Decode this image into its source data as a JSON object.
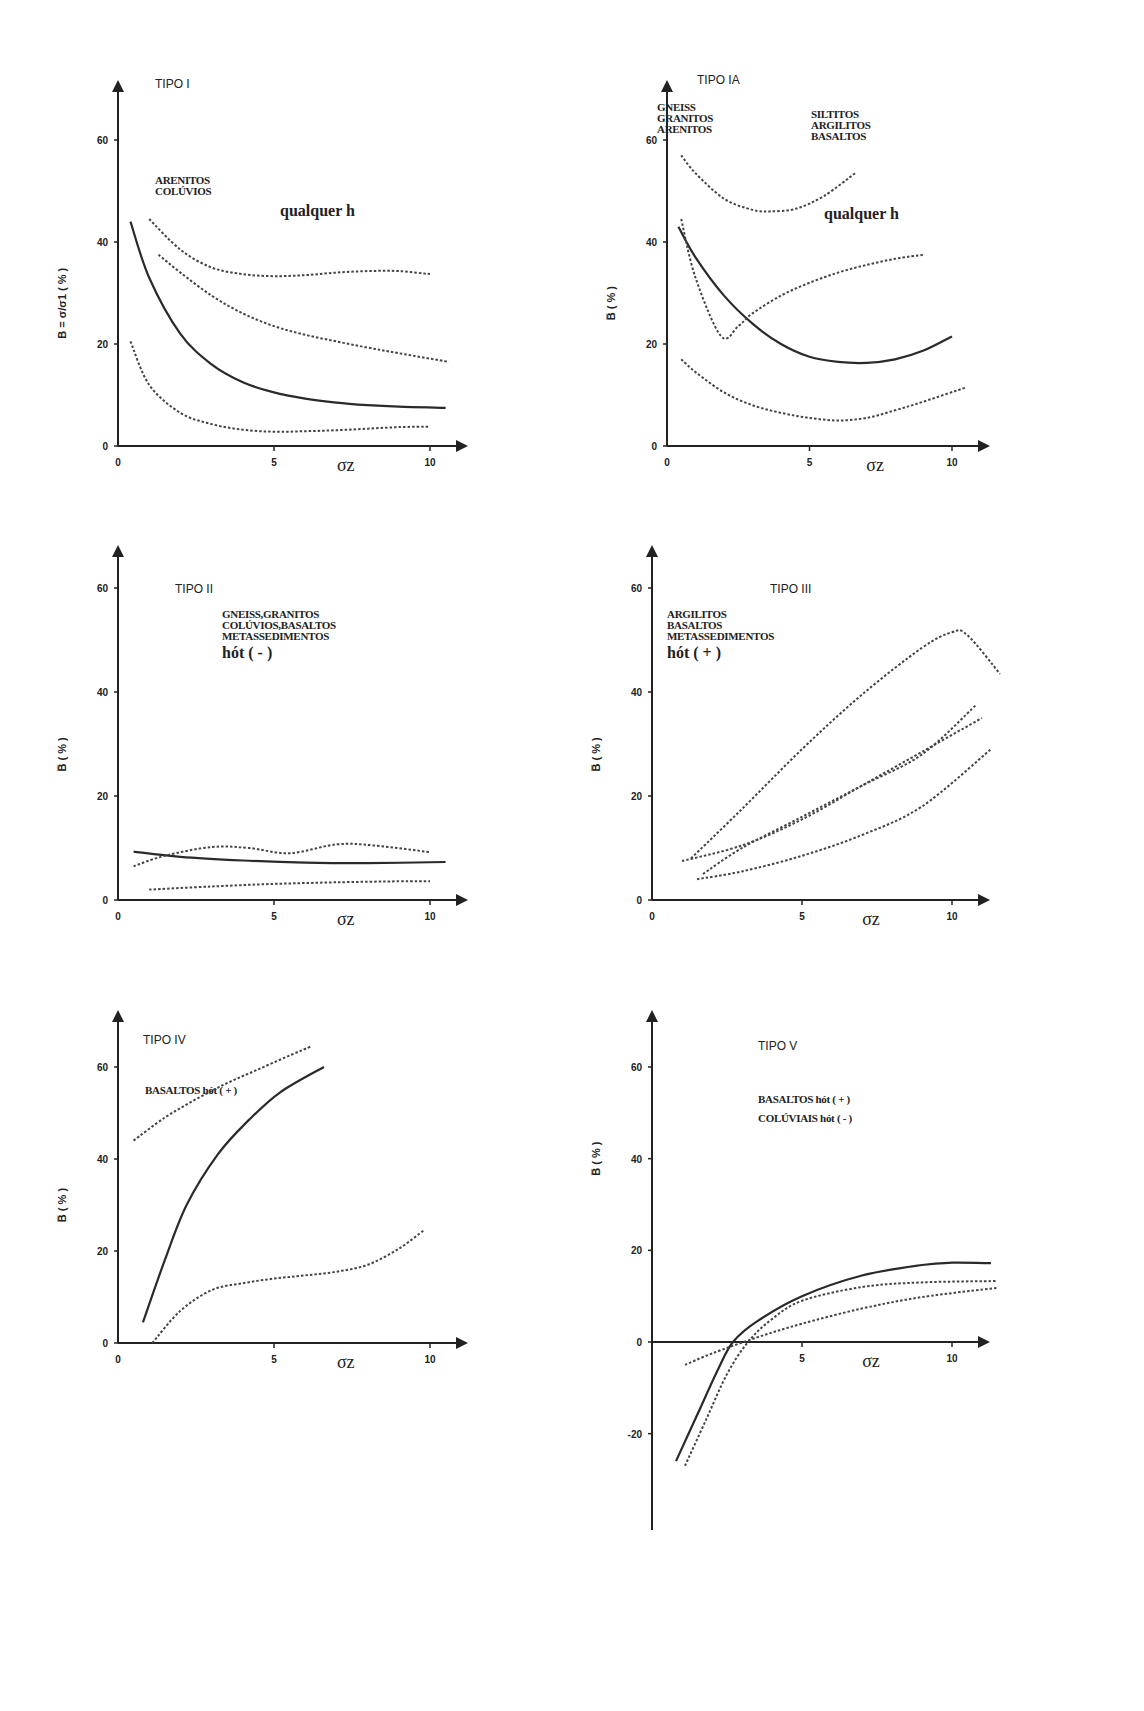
{
  "figure": {
    "panels": [
      {
        "title": "TIPO I",
        "rocks": [
          "ARENITOS",
          "COLÚVIOS"
        ],
        "note": "qualquer h",
        "ylabel": "B = σ/σ1 ( % )",
        "xlabel": "σz"
      },
      {
        "title": "TIPO IA",
        "rocks_left": [
          "GNEISS",
          "GRANITOS",
          "ARENITOS"
        ],
        "rocks_right": [
          "SILTITOS",
          "ARGILITOS",
          "BASALTOS"
        ],
        "note": "qualquer h",
        "ylabel": "B̅ ( % )",
        "xlabel": "σz"
      },
      {
        "title": "TIPO II",
        "rocks": [
          "GNEISS,GRANITOS",
          "COLÚVIOS,BASALTOS",
          "METASSEDIMENTOS"
        ],
        "note": "hót ( - )",
        "ylabel": "B̅ ( % )",
        "xlabel": "σz"
      },
      {
        "title": "TIPO III",
        "rocks": [
          "ARGILITOS",
          "BASALTOS",
          "METASSEDIMENTOS"
        ],
        "note": "hót ( + )",
        "ylabel": "B̅ ( % )",
        "xlabel": "σz"
      },
      {
        "title": "TIPO IV",
        "rocks": [
          "BASALTOS hót ( + )"
        ],
        "ylabel": "B̅ ( % )",
        "xlabel": "σz"
      },
      {
        "title": "TIPO V",
        "rocks": [
          "BASALTOS  hót ( + )",
          "COLÚVIAIS hót ( - )"
        ],
        "ylabel": "B̅ ( % )",
        "xlabel": "σz"
      }
    ]
  },
  "chart_data": [
    {
      "type": "line",
      "title": "TIPO I",
      "xlabel": "σz",
      "ylabel": "B = σ/σ1 (%)",
      "xlim": [
        0,
        11
      ],
      "ylim": [
        0,
        65
      ],
      "xticks": [
        0,
        5,
        10
      ],
      "yticks": [
        0,
        20,
        40,
        60
      ],
      "grid": false,
      "annotations": [
        "ARENITOS",
        "COLÚVIOS",
        "qualquer h"
      ],
      "series": [
        {
          "name": "solid",
          "style": "solid",
          "x": [
            0.4,
            1,
            2,
            3,
            4,
            5,
            6,
            7,
            8,
            9,
            10.5
          ],
          "y": [
            44,
            33,
            22,
            16,
            12.5,
            10.5,
            9.3,
            8.5,
            8,
            7.7,
            7.5
          ]
        },
        {
          "name": "dotted upper",
          "style": "dotted",
          "x": [
            1,
            2,
            3,
            4,
            5,
            6,
            7,
            8,
            9,
            10
          ],
          "y": [
            44.5,
            38.5,
            35,
            33.7,
            33.3,
            33.5,
            34,
            34.3,
            34.3,
            33.7
          ]
        },
        {
          "name": "dotted middle",
          "style": "dotted",
          "x": [
            1.3,
            2,
            3,
            4,
            5,
            6,
            7,
            8,
            9,
            10.6
          ],
          "y": [
            37.5,
            34,
            29.5,
            26,
            23.5,
            21.8,
            20.5,
            19.3,
            18.2,
            16.5
          ]
        },
        {
          "name": "dotted lower",
          "style": "dotted",
          "x": [
            0.4,
            1,
            2,
            3,
            4,
            5,
            6,
            7,
            8,
            9,
            10
          ],
          "y": [
            20.5,
            12,
            6.5,
            4.3,
            3.2,
            2.8,
            2.9,
            3.1,
            3.4,
            3.7,
            3.8
          ]
        }
      ]
    },
    {
      "type": "line",
      "title": "TIPO IA",
      "xlabel": "σz",
      "ylabel": "B̅ (%)",
      "xlim": [
        0,
        11
      ],
      "ylim": [
        0,
        68
      ],
      "xticks": [
        0,
        5,
        10
      ],
      "yticks": [
        0,
        20,
        40,
        60
      ],
      "grid": false,
      "annotations": [
        "GNEISS",
        "GRANITOS",
        "ARENITOS",
        "SILTITOS",
        "ARGILITOS",
        "BASALTOS",
        "qualquer h"
      ],
      "series": [
        {
          "name": "dotted arc",
          "style": "dotted",
          "x": [
            0.5,
            1,
            2,
            3,
            3.6,
            4.5,
            5.5,
            6.6
          ],
          "y": [
            57,
            53.5,
            48.5,
            46.3,
            46,
            46.5,
            49,
            53.5
          ]
        },
        {
          "name": "solid",
          "style": "solid",
          "x": [
            0.4,
            1,
            2,
            3,
            4,
            5,
            6,
            7,
            8,
            9,
            10
          ],
          "y": [
            43,
            37,
            29.5,
            24,
            20,
            17.5,
            16.5,
            16.3,
            17,
            18.7,
            21.5
          ]
        },
        {
          "name": "dotted V",
          "style": "dotted",
          "x": [
            0.5,
            1,
            1.9,
            2.5,
            3,
            4,
            5,
            6,
            7,
            8,
            9
          ],
          "y": [
            44.5,
            33,
            21.5,
            23.5,
            26,
            29.5,
            32,
            34,
            35.5,
            36.7,
            37.5
          ]
        },
        {
          "name": "dotted lower",
          "style": "dotted",
          "x": [
            0.5,
            1,
            2,
            3,
            4,
            5,
            6,
            7,
            8,
            9,
            10.5
          ],
          "y": [
            17,
            14.5,
            10.5,
            8,
            6.5,
            5.5,
            5,
            5.5,
            7,
            8.7,
            11.5
          ]
        }
      ]
    },
    {
      "type": "line",
      "title": "TIPO II",
      "xlabel": "σz",
      "ylabel": "B̅ (%)",
      "xlim": [
        0,
        11
      ],
      "ylim": [
        0,
        68
      ],
      "xticks": [
        0,
        5,
        10
      ],
      "yticks": [
        0,
        20,
        40,
        60
      ],
      "grid": false,
      "annotations": [
        "GNEISS,GRANITOS",
        "COLÚVIOS,BASALTOS",
        "METASSEDIMENTOS",
        "hót ( - )"
      ],
      "series": [
        {
          "name": "solid",
          "style": "solid",
          "x": [
            0.5,
            2,
            4,
            6,
            8,
            10.5
          ],
          "y": [
            9.3,
            8.3,
            7.6,
            7.2,
            7.1,
            7.3
          ]
        },
        {
          "name": "dotted wavy",
          "style": "dotted",
          "x": [
            0.5,
            1.5,
            3,
            4.2,
            5.5,
            7,
            8.2,
            10
          ],
          "y": [
            6.5,
            8.5,
            10.2,
            10,
            9,
            10.7,
            10.5,
            9.2
          ]
        },
        {
          "name": "dotted lower",
          "style": "dotted",
          "x": [
            1,
            3,
            5,
            7,
            9,
            10
          ],
          "y": [
            2,
            2.6,
            3.1,
            3.4,
            3.6,
            3.6
          ]
        }
      ]
    },
    {
      "type": "line",
      "title": "TIPO III",
      "xlabel": "σz",
      "ylabel": "B̅ (%)",
      "xlim": [
        0,
        11.5
      ],
      "ylim": [
        0,
        68
      ],
      "xticks": [
        0,
        5,
        10
      ],
      "yticks": [
        0,
        20,
        40,
        60
      ],
      "grid": false,
      "annotations": [
        "ARGILITOS",
        "BASALTOS",
        "METASSEDIMENTOS",
        "hót ( + )"
      ],
      "series": [
        {
          "name": "dotted steep",
          "style": "dotted",
          "x": [
            1.3,
            3,
            5,
            7,
            9,
            10,
            10.5,
            11.6
          ],
          "y": [
            8,
            17.5,
            29,
            39.5,
            48.5,
            51.5,
            51,
            43.5
          ]
        },
        {
          "name": "dotted mid 1",
          "style": "dotted",
          "x": [
            1,
            3,
            5,
            7,
            9,
            11
          ],
          "y": [
            7.5,
            10.5,
            15.5,
            22,
            28.5,
            35
          ]
        },
        {
          "name": "dotted mid 2",
          "style": "dotted",
          "x": [
            1.7,
            3,
            5,
            7,
            9,
            10.8
          ],
          "y": [
            5,
            10,
            16,
            22,
            28,
            37.5
          ]
        },
        {
          "name": "dotted low",
          "style": "dotted",
          "x": [
            1.5,
            3,
            5,
            7,
            9,
            11.3
          ],
          "y": [
            4,
            5.5,
            8.5,
            12.5,
            18,
            29
          ]
        }
      ]
    },
    {
      "type": "line",
      "title": "TIPO IV",
      "xlabel": "σz",
      "ylabel": "B̅ (%)",
      "xlim": [
        0,
        11
      ],
      "ylim": [
        0,
        68
      ],
      "xticks": [
        0,
        5,
        10
      ],
      "yticks": [
        0,
        20,
        40,
        60
      ],
      "grid": false,
      "annotations": [
        "BASALTOS hót ( + )"
      ],
      "series": [
        {
          "name": "dotted upper",
          "style": "dotted",
          "x": [
            0.5,
            1.5,
            2.5,
            3.5,
            4.5,
            5.5,
            6.2
          ],
          "y": [
            44,
            49,
            53,
            56.5,
            59.5,
            62.5,
            64.5
          ]
        },
        {
          "name": "solid",
          "style": "solid",
          "x": [
            0.8,
            1.5,
            2.2,
            3.2,
            4.2,
            5.2,
            6.6
          ],
          "y": [
            4.5,
            18,
            30,
            41,
            48.5,
            54.5,
            60
          ]
        },
        {
          "name": "dotted lower",
          "style": "dotted",
          "x": [
            1.1,
            2,
            3,
            4,
            5,
            6,
            7,
            8,
            9,
            9.8
          ],
          "y": [
            0,
            7,
            11.5,
            13,
            14,
            14.7,
            15.5,
            17,
            20.5,
            24.5
          ]
        }
      ]
    },
    {
      "type": "line",
      "title": "TIPO V",
      "xlabel": "σz",
      "ylabel": "B̅ (%)",
      "xlim": [
        0,
        11.5
      ],
      "ylim": [
        -28,
        68
      ],
      "xticks": [
        5,
        10
      ],
      "yticks": [
        -20,
        0,
        20,
        40,
        60
      ],
      "grid": false,
      "annotations": [
        "BASALTOS  hót ( + )",
        "COLÚVIAIS hót ( - )"
      ],
      "series": [
        {
          "name": "solid",
          "style": "solid",
          "x": [
            0.8,
            1.5,
            2.2,
            2.7,
            3.5,
            5,
            7,
            9,
            10,
            11.3
          ],
          "y": [
            -26,
            -16,
            -6,
            0,
            4.5,
            10,
            14.5,
            16.8,
            17.3,
            17.2
          ]
        },
        {
          "name": "dotted steep",
          "style": "dotted",
          "x": [
            1.1,
            1.8,
            2.5,
            3.2,
            4,
            5,
            7,
            9,
            11.5
          ],
          "y": [
            -27,
            -17,
            -7,
            0,
            5,
            9,
            12,
            13,
            13.3
          ]
        },
        {
          "name": "dotted shallow",
          "style": "dotted",
          "x": [
            1.1,
            2,
            3.5,
            5,
            7,
            9,
            11.5
          ],
          "y": [
            -5,
            -2.5,
            1,
            4,
            7.3,
            9.8,
            11.8
          ]
        }
      ]
    }
  ]
}
